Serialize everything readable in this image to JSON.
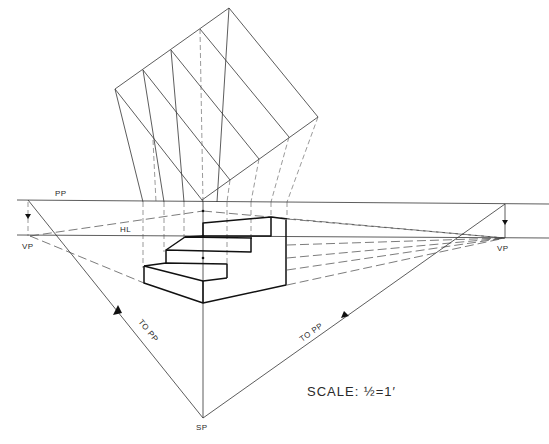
{
  "figure": {
    "labels": {
      "picture_plane": "PP",
      "horizon_line": "HL",
      "vanishing_point_left": "VP",
      "vanishing_point_right": "VP",
      "station_point": "SP",
      "to_pp_left": "TO PP",
      "to_pp_right": "TO PP"
    },
    "scale_text": "SCALE:  ½=1′",
    "plan": {
      "description": "Rotated plan view of stair with 3 risers projected down to picture plane",
      "step_count": 3
    },
    "stair": {
      "description": "Three-step stair block drawn in two-point perspective",
      "step_count": 3
    },
    "colors": {
      "ink": "#222222",
      "paper": "#ffffff"
    }
  }
}
